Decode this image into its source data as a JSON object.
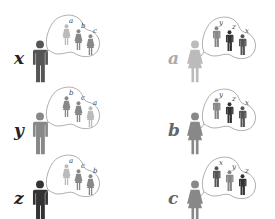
{
  "diagram": {
    "colors": {
      "a": "#bbbbbb",
      "b": "#888888",
      "c": "#888888",
      "x": "#555555",
      "y": "#888888",
      "z": "#333333",
      "bubble_stroke": "#999999"
    },
    "men": [
      {
        "name": "x",
        "preferences": [
          "a",
          "b",
          "c"
        ]
      },
      {
        "name": "y",
        "preferences": [
          "b",
          "c",
          "a"
        ]
      },
      {
        "name": "z",
        "preferences": [
          "a",
          "c",
          "b"
        ]
      }
    ],
    "women": [
      {
        "name": "a",
        "preferences": [
          "y",
          "z",
          "x"
        ]
      },
      {
        "name": "b",
        "preferences": [
          "y",
          "z",
          "x"
        ]
      },
      {
        "name": "c",
        "preferences": [
          "x",
          "y",
          "z"
        ]
      }
    ]
  }
}
